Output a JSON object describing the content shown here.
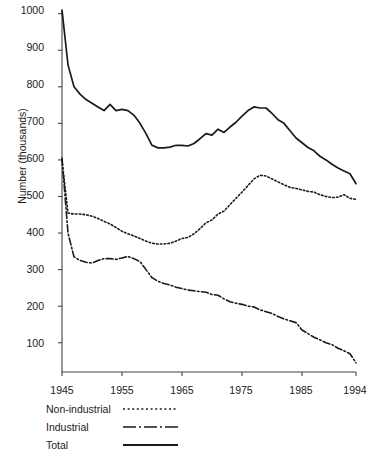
{
  "chart_data": {
    "type": "line",
    "title": "",
    "subtitle": "",
    "xlabel": "",
    "ylabel": "Number (thousands)",
    "xlim": [
      1945,
      1994
    ],
    "ylim": [
      20,
      1010
    ],
    "grid": false,
    "legend_position": "below-left",
    "xticks": [
      "1945",
      "1955",
      "1965",
      "1975",
      "1985",
      "1994"
    ],
    "xtick_values": [
      1945,
      1955,
      1965,
      1975,
      1985,
      1994
    ],
    "yticks": [
      "100",
      "200",
      "300",
      "400",
      "500",
      "600",
      "700",
      "800",
      "900",
      "1000"
    ],
    "ytick_values": [
      100,
      200,
      300,
      400,
      500,
      600,
      700,
      800,
      900,
      1000
    ],
    "x": [
      1945,
      1946,
      1947,
      1948,
      1949,
      1950,
      1951,
      1952,
      1953,
      1954,
      1955,
      1956,
      1957,
      1958,
      1959,
      1960,
      1961,
      1962,
      1963,
      1964,
      1965,
      1966,
      1967,
      1968,
      1969,
      1970,
      1971,
      1972,
      1973,
      1974,
      1975,
      1976,
      1977,
      1978,
      1979,
      1980,
      1981,
      1982,
      1983,
      1984,
      1985,
      1986,
      1987,
      1988,
      1989,
      1990,
      1991,
      1992,
      1993,
      1994
    ],
    "series": [
      {
        "name": "Total",
        "style": "solid",
        "color": "#1a1a1a",
        "values": [
          1010,
          860,
          800,
          780,
          765,
          755,
          745,
          735,
          752,
          735,
          738,
          735,
          722,
          700,
          672,
          640,
          633,
          633,
          635,
          640,
          640,
          638,
          645,
          658,
          672,
          668,
          684,
          675,
          690,
          703,
          720,
          735,
          745,
          742,
          742,
          727,
          710,
          700,
          680,
          660,
          647,
          634,
          625,
          610,
          600,
          588,
          578,
          570,
          562,
          535
        ]
      },
      {
        "name": "Non-industrial",
        "style": "dotted",
        "color": "#1a1a1a",
        "values": [
          600,
          455,
          452,
          452,
          450,
          446,
          440,
          432,
          425,
          415,
          405,
          398,
          392,
          385,
          378,
          372,
          370,
          370,
          372,
          378,
          385,
          388,
          398,
          412,
          428,
          436,
          452,
          460,
          478,
          495,
          512,
          530,
          548,
          558,
          556,
          548,
          540,
          532,
          525,
          522,
          518,
          514,
          512,
          505,
          500,
          497,
          498,
          505,
          495,
          492
        ]
      },
      {
        "name": "Industrial",
        "style": "dashdot",
        "color": "#1a1a1a",
        "values": [
          605,
          400,
          335,
          325,
          320,
          318,
          325,
          330,
          330,
          328,
          332,
          336,
          330,
          322,
          300,
          278,
          268,
          262,
          258,
          252,
          248,
          244,
          242,
          240,
          238,
          232,
          230,
          220,
          212,
          208,
          205,
          200,
          198,
          190,
          185,
          180,
          172,
          165,
          160,
          155,
          135,
          125,
          115,
          108,
          100,
          95,
          85,
          78,
          70,
          45
        ]
      }
    ],
    "legend": [
      {
        "label": "Non-industrial",
        "style": "dotted"
      },
      {
        "label": "Industrial",
        "style": "dashdot"
      },
      {
        "label": "Total",
        "style": "solid"
      }
    ]
  }
}
